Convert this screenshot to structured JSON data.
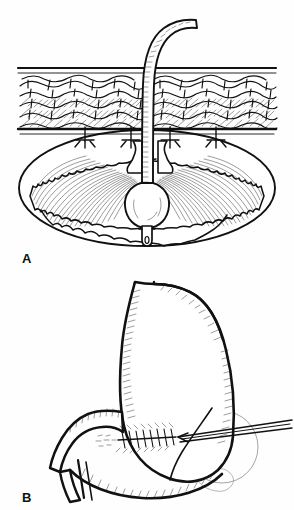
{
  "figure": {
    "style": "black-and-white pen-and-ink medical illustration",
    "background_color": "#ffffff",
    "ink_color": "#111111",
    "ghost_color": "#8d8d8d",
    "width": 294,
    "height": 510
  },
  "panels": [
    {
      "id": "A",
      "label": "A",
      "label_position": {
        "x": 22,
        "y": 263
      },
      "caption_text": "A",
      "view": "cross-sectional view of abdominal wall and stomach lumen",
      "elements": [
        {
          "name": "feeding-tube",
          "description": "balloon gastrostomy tube curving from upper right down through abdominal wall"
        },
        {
          "name": "tube-graduation-marks",
          "description": "fine tick marks along tube shaft"
        },
        {
          "name": "abdominal-wall",
          "description": "horizontal banded layer with cobblestone fat and muscle texture"
        },
        {
          "name": "skin-line",
          "description": "upper boundary line of abdominal wall"
        },
        {
          "name": "peritoneum-line",
          "description": "lower boundary line of abdominal wall"
        },
        {
          "name": "t-fastener",
          "count": 4,
          "description": "T-shaped anchor sutures fixing stomach to abdominal wall"
        },
        {
          "name": "stomach-lumen",
          "description": "large ellipse representing opened stomach interior"
        },
        {
          "name": "gastric-mucosa-folds",
          "description": "scalloped inner margin with dense hatched shading"
        },
        {
          "name": "retention-balloon",
          "description": "inflated balloon at tube tip inside stomach"
        }
      ]
    },
    {
      "id": "B",
      "label": "B",
      "label_position": {
        "x": 22,
        "y": 502
      },
      "caption_text": "B",
      "view": "anterior view of stomach with suture line and instrument",
      "elements": [
        {
          "name": "esophagus",
          "description": "tubular structure entering at top of stomach"
        },
        {
          "name": "gastric-fundus",
          "description": "rounded upper stomach dome"
        },
        {
          "name": "greater-curvature",
          "description": "long convex right border of stomach"
        },
        {
          "name": "lesser-curvature",
          "description": "concave left border of stomach"
        },
        {
          "name": "gastric-antrum",
          "description": "lower tapering portion of stomach"
        },
        {
          "name": "duodenum",
          "description": "curved bowel segment exiting at lower left"
        },
        {
          "name": "suture-line",
          "description": "running fishbone stitch line across the distal stomach"
        },
        {
          "name": "surgical-instrument",
          "description": "straight shaft instrument entering from right toward suture line"
        },
        {
          "name": "ghost-organ",
          "description": "faint gray circular outline of adjacent organ behind instrument"
        }
      ]
    }
  ],
  "labels": {
    "panel_a": "A",
    "panel_b": "B"
  }
}
